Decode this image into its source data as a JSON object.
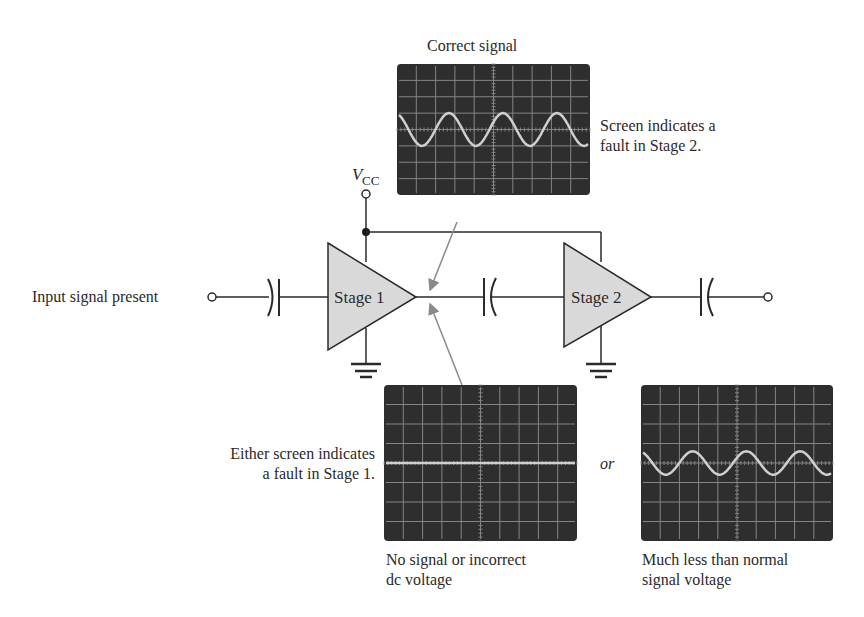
{
  "labels": {
    "correct_signal": "Correct signal",
    "stage2_fault_line1": "Screen indicates a",
    "stage2_fault_line2": "fault in Stage 2.",
    "input_signal": "Input signal present",
    "vcc_main": "V",
    "vcc_sub": "CC",
    "stage1": "Stage 1",
    "stage2": "Stage 2",
    "stage1_fault_line1": "Either screen indicates",
    "stage1_fault_line2": "a fault in Stage 1.",
    "or": "or",
    "no_signal_line1": "No signal or incorrect",
    "no_signal_line2": "dc voltage",
    "less_signal_line1": "Much less than normal",
    "less_signal_line2": "signal voltage"
  },
  "scopes": [
    {
      "id": "correct",
      "caption": "Correct signal",
      "trace": "sine",
      "amplitude_div": 1.0,
      "cycles": 3.5,
      "grid_cols": 10,
      "grid_rows": 8
    },
    {
      "id": "no-signal",
      "caption": "No signal or incorrect dc voltage",
      "trace": "flat",
      "amplitude_div": 0,
      "cycles": 0,
      "grid_cols": 10,
      "grid_rows": 8
    },
    {
      "id": "low-signal",
      "caption": "Much less than normal signal voltage",
      "trace": "sine",
      "amplitude_div": 0.6,
      "cycles": 3.5,
      "grid_cols": 10,
      "grid_rows": 8
    }
  ],
  "colors": {
    "scope_bg": "#2e2e2e",
    "grid": "#9a9a9a",
    "trace": "#cfcfcf",
    "amp_fill": "#d9d9d9",
    "wire": "#2a2a2a",
    "arrow": "#8a8a8a"
  }
}
